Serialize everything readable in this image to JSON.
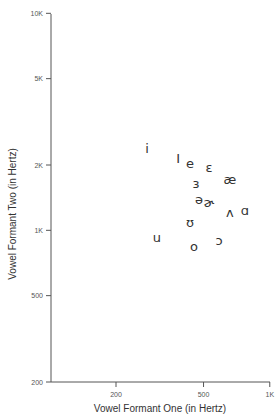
{
  "chart_data": {
    "type": "scatter",
    "title": "",
    "xlabel": "Vowel Formant One (in Hertz)",
    "ylabel": "Vowel Formant Two (in Hertz)",
    "xscale": "log",
    "yscale": "log",
    "xlim": [
      100,
      1000
    ],
    "ylim": [
      200,
      10000
    ],
    "xticks": [
      {
        "value": 200,
        "label": "200"
      },
      {
        "value": 500,
        "label": "500"
      },
      {
        "value": 1000,
        "label": "1K"
      }
    ],
    "yticks": [
      {
        "value": 200,
        "label": "200"
      },
      {
        "value": 500,
        "label": "500"
      },
      {
        "value": 1000,
        "label": "1K"
      },
      {
        "value": 2000,
        "label": "2K"
      },
      {
        "value": 5000,
        "label": "5K"
      },
      {
        "value": 10000,
        "label": "10K"
      }
    ],
    "grid": false,
    "legend": null,
    "marker_style": "IPA vowel symbols used as point labels",
    "points": [
      {
        "label": "i",
        "f1": 277,
        "f2": 2394
      },
      {
        "label": "I",
        "f1": 383,
        "f2": 2132
      },
      {
        "label": "e",
        "f1": 434,
        "f2": 2041
      },
      {
        "label": "ɛ",
        "f1": 529,
        "f2": 1958
      },
      {
        "label": "æ",
        "f1": 659,
        "f2": 1723
      },
      {
        "label": "ɜ",
        "f1": 462,
        "f2": 1652
      },
      {
        "label": "ə",
        "f1": 477,
        "f2": 1393
      },
      {
        "label": "ɚ",
        "f1": 529,
        "f2": 1350
      },
      {
        "label": "ʌ",
        "f1": 659,
        "f2": 1214
      },
      {
        "label": "ɑ",
        "f1": 771,
        "f2": 1228
      },
      {
        "label": "ʊ",
        "f1": 434,
        "f2": 1092
      },
      {
        "label": "u",
        "f1": 307,
        "f2": 922
      },
      {
        "label": "o",
        "f1": 452,
        "f2": 838
      },
      {
        "label": "ɔ",
        "f1": 588,
        "f2": 902
      }
    ]
  },
  "style": {
    "axis_color": "#555555",
    "text_color": "#333333",
    "background": "#ffffff"
  }
}
